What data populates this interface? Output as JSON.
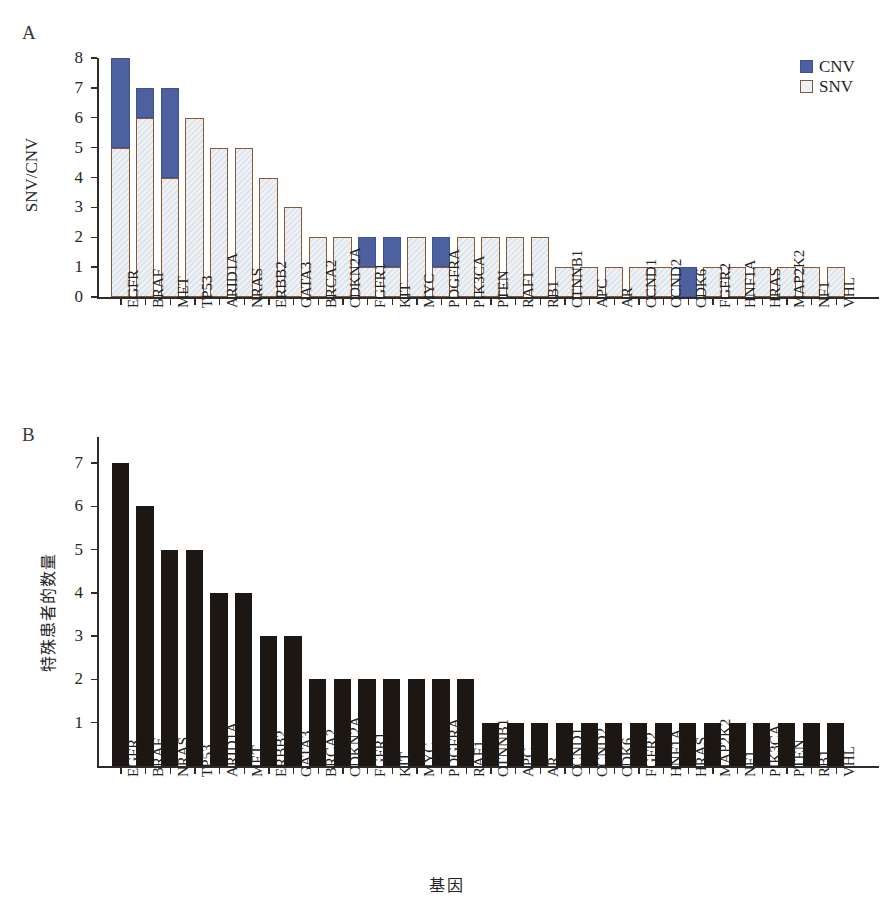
{
  "figure": {
    "panel_a_letter": "A",
    "panel_b_letter": "B",
    "x_axis_title": "基因"
  },
  "legend": {
    "position": "top-right",
    "items": [
      {
        "label": "CNV",
        "color": "#4d61a0",
        "swatch": "cnv"
      },
      {
        "label": "SNV",
        "color": "#dde4ec",
        "border": "#8a5733",
        "swatch": "snv"
      }
    ]
  },
  "chart_data": [
    {
      "type": "bar",
      "id": "panel-a",
      "title": "A",
      "stacked": true,
      "xlabel": "",
      "ylabel": "SNV/CNV",
      "ylim": [
        0,
        8
      ],
      "yticks": [
        0,
        1,
        2,
        3,
        4,
        5,
        6,
        7,
        8
      ],
      "grid": false,
      "legend": [
        "CNV",
        "SNV"
      ],
      "categories": [
        "EGFR",
        "BRAF",
        "MET",
        "TP53",
        "ARID1A",
        "NRAS",
        "ERBB2",
        "GATA3",
        "BRCA2",
        "CDKN2A",
        "FGFR1",
        "KIT",
        "MYC",
        "PDGFRA",
        "PIK3CA",
        "PTEN",
        "RAF1",
        "RB1",
        "CTNNB1",
        "APC",
        "AR",
        "CCND1",
        "CCND2",
        "CDK6",
        "FGFR2",
        "HNF1A",
        "HRAS",
        "MAP2K2",
        "NF1",
        "VHL"
      ],
      "series": [
        {
          "name": "SNV",
          "color": "#dde4ec",
          "values": [
            5,
            6,
            4,
            6,
            5,
            5,
            4,
            3,
            2,
            2,
            1,
            1,
            2,
            1,
            2,
            2,
            2,
            2,
            1,
            1,
            1,
            1,
            1,
            0,
            1,
            1,
            1,
            1,
            1,
            1
          ]
        },
        {
          "name": "CNV",
          "color": "#4d61a0",
          "values": [
            3,
            1,
            3,
            0,
            0,
            0,
            0,
            0,
            0,
            0,
            1,
            1,
            0,
            1,
            0,
            0,
            0,
            0,
            0,
            0,
            0,
            0,
            0,
            1,
            0,
            0,
            0,
            0,
            0,
            0
          ]
        }
      ],
      "totals": [
        8,
        7,
        7,
        6,
        5,
        5,
        4,
        3,
        2,
        2,
        2,
        2,
        2,
        2,
        2,
        2,
        2,
        2,
        1,
        1,
        1,
        1,
        1,
        1,
        1,
        1,
        1,
        1,
        1,
        1
      ]
    },
    {
      "type": "bar",
      "id": "panel-b",
      "title": "B",
      "stacked": false,
      "xlabel": "基因",
      "ylabel": "特殊患者的数量",
      "ylim": [
        0,
        7.6
      ],
      "yticks": [
        1,
        2,
        3,
        4,
        5,
        6,
        7
      ],
      "grid": false,
      "bar_color": "#1c1712",
      "categories": [
        "EGFR",
        "BRAF",
        "NRAS",
        "TP53",
        "ARID1A",
        "MET",
        "ERBB2",
        "GATA3",
        "BRCA2",
        "CDKN2A",
        "FGFR1",
        "KIT",
        "MYC",
        "PDGFRA",
        "RAF1",
        "CTNNB1",
        "APC",
        "AR",
        "CCND1",
        "CCND2",
        "CDK6",
        "FGFR2",
        "HNF1A",
        "HRAS",
        "MAP2K2",
        "NF1",
        "PIK3CA",
        "PTEN",
        "RB1",
        "VHL"
      ],
      "values": [
        7,
        6,
        5,
        5,
        4,
        4,
        3,
        3,
        2,
        2,
        2,
        2,
        2,
        2,
        2,
        1,
        1,
        1,
        1,
        1,
        1,
        1,
        1,
        1,
        1,
        1,
        1,
        1,
        1,
        1
      ]
    }
  ]
}
